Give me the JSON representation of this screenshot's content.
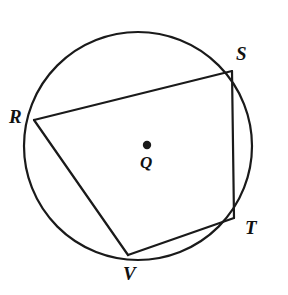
{
  "figure": {
    "type": "geometry-diagram",
    "canvas": {
      "width": 288,
      "height": 295,
      "background": "#ffffff"
    },
    "stroke_color": "#1a1a1a",
    "circle": {
      "name": "circle-Q",
      "center_label": "Q",
      "center_x": 138,
      "center_y": 146,
      "radius": 114,
      "stroke_width": 2.2
    },
    "center_point": {
      "name": "center-dot",
      "x": 147,
      "y": 145,
      "radius": 4.2,
      "label": "Q",
      "label_x": 147,
      "label_y": 165
    },
    "vertices": [
      {
        "label": "R",
        "x": 34,
        "y": 120,
        "label_x": 16,
        "label_y": 116
      },
      {
        "label": "S",
        "x": 232,
        "y": 71,
        "label_x": 243,
        "label_y": 53
      },
      {
        "label": "T",
        "x": 234,
        "y": 218,
        "label_x": 251,
        "label_y": 227
      },
      {
        "label": "V",
        "x": 128,
        "y": 255,
        "label_x": 131,
        "label_y": 273
      }
    ],
    "chords": [
      {
        "name": "chord-RS",
        "from": "R",
        "to": "S",
        "x1": 34,
        "y1": 120,
        "x2": 232,
        "y2": 71
      },
      {
        "name": "chord-ST",
        "from": "S",
        "to": "T",
        "x1": 232,
        "y1": 71,
        "x2": 234,
        "y2": 218
      },
      {
        "name": "chord-TV",
        "from": "T",
        "to": "V",
        "x1": 234,
        "y1": 218,
        "x2": 128,
        "y2": 255
      },
      {
        "name": "chord-VR",
        "from": "V",
        "to": "R",
        "x1": 128,
        "y1": 255,
        "x2": 34,
        "y2": 120
      }
    ]
  }
}
